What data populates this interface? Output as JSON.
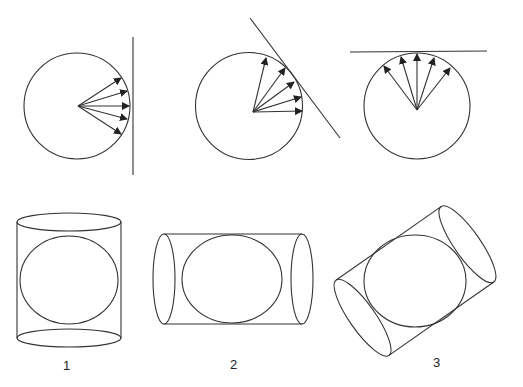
{
  "diagram": {
    "panels": [
      {
        "id": "tangent-vertical",
        "circle": {
          "cx": 77,
          "cy": 106,
          "r": 53
        },
        "line": [
          133,
          37,
          133,
          175
        ],
        "arrow_angles_deg": [
          -32,
          -16,
          0,
          14,
          30
        ]
      },
      {
        "id": "tangent-diagonal",
        "circle": {
          "cx": 253,
          "cy": 112,
          "r": 53.5
        },
        "line": [
          250,
          18,
          340,
          138
        ],
        "arrow_angles_deg": [
          -75,
          -57,
          -40,
          -22,
          -5
        ]
      },
      {
        "id": "tangent-horizontal",
        "circle": {
          "cx": 417,
          "cy": 109,
          "r": 53
        },
        "line": [
          350,
          52,
          487,
          52
        ],
        "arrow_angles_deg": [
          -145,
          -115,
          -90,
          -67,
          -40
        ]
      }
    ],
    "cylinders": [
      {
        "label": "1",
        "orientation": "vertical"
      },
      {
        "label": "2",
        "orientation": "horizontal"
      },
      {
        "label": "3",
        "orientation": "diagonal"
      }
    ]
  },
  "colors": {
    "stroke": "#333333",
    "background": "#ffffff"
  }
}
